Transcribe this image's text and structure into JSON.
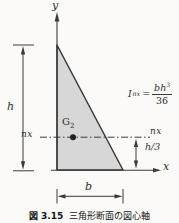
{
  "figure": {
    "caption": {
      "number": "図 3.15",
      "title": "三角形断面の図心軸"
    },
    "labels": {
      "y_axis": "y",
      "x_axis": "x",
      "height": "h",
      "base": "b",
      "neutral_axis_left": "nx",
      "neutral_axis_right": "nx",
      "centroid_height": "h/3",
      "centroid_symbol": "G",
      "centroid_subscript": "2"
    },
    "formula": {
      "symbol": "I",
      "subscript": "nx",
      "equals": "=",
      "numerator_base": "bh",
      "numerator_exponent": "3",
      "denominator": "36"
    },
    "colors": {
      "triangle_fill": "#d7d7d7",
      "line": "#3a3a3a",
      "text": "#2e2e2e",
      "background": "#fbfaf8"
    }
  }
}
